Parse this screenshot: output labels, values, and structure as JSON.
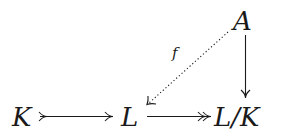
{
  "diagram": {
    "type": "commutative-diagram",
    "nodes": {
      "A": "A",
      "K": "K",
      "L": "L",
      "LK": "L/K"
    },
    "edges": [
      {
        "from": "K",
        "to": "L",
        "style": "solid",
        "head": "single",
        "tail": "mono",
        "label": ""
      },
      {
        "from": "L",
        "to": "L/K",
        "style": "solid",
        "head": "double",
        "tail": "none",
        "label": ""
      },
      {
        "from": "A",
        "to": "L/K",
        "style": "solid",
        "head": "single",
        "tail": "none",
        "label": ""
      },
      {
        "from": "A",
        "to": "L",
        "style": "dotted",
        "head": "single",
        "tail": "none",
        "label": "f"
      }
    ],
    "labels": {
      "f": "f"
    },
    "colors": {
      "ink": "#1a1a1a",
      "background": "#ffffff"
    }
  }
}
